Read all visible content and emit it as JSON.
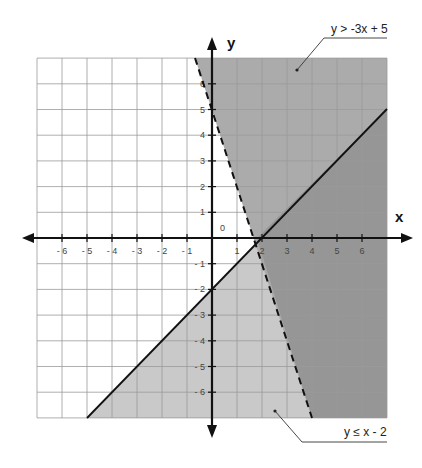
{
  "chart_data": {
    "type": "line",
    "title": "",
    "xlabel": "x",
    "ylabel": "y",
    "xlim": [
      -7,
      7
    ],
    "ylim": [
      -7,
      7
    ],
    "grid": true,
    "x_ticks": [
      "-6",
      "-5",
      "-4",
      "-3",
      "-2",
      "-1",
      "1",
      "2",
      "3",
      "4",
      "5",
      "6"
    ],
    "y_ticks": [
      "6",
      "5",
      "4",
      "3",
      "2",
      "1",
      "-1",
      "-2",
      "-3",
      "-4",
      "-5",
      "-6"
    ],
    "origin_label": "0",
    "series": [
      {
        "name": "y > -3x + 5",
        "equation": "y = -3x + 5",
        "style": "dashed",
        "shade": "above",
        "points": [
          [
            -0.67,
            7
          ],
          [
            4,
            -7
          ]
        ]
      },
      {
        "name": "y ≤ x - 2",
        "equation": "y = x - 2",
        "style": "solid",
        "shade": "below",
        "points": [
          [
            -5,
            -7
          ],
          [
            7,
            5
          ]
        ]
      }
    ],
    "annotations": [
      {
        "text": "y > -3x + 5",
        "points_to": [
          3.3,
          6.1
        ]
      },
      {
        "text": "y ≤ x - 2",
        "points_to": [
          2.3,
          -6.5
        ]
      }
    ],
    "colors": {
      "region_first_only": "#ababab",
      "region_second_only": "#c9c9c9",
      "region_both": "#969696",
      "grid": "#9a9a9a",
      "axes": "#111111"
    }
  },
  "labels": {
    "x_axis": "x",
    "y_axis": "y",
    "origin": "0",
    "annotation_top": "y > -3x + 5",
    "annotation_bottom": "y ≤ x - 2"
  }
}
